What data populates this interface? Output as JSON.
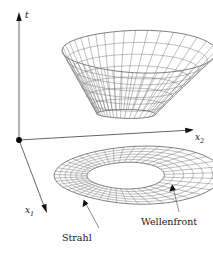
{
  "figure": {
    "background_color": "#ffffff",
    "line_color": "#6f6f6f",
    "outline_color": "#3a3a3a",
    "axis_color": "#555555",
    "text_color": "#1a1a1a"
  },
  "axes": {
    "vertical": {
      "name": "t-axis",
      "label": "t",
      "italic": true,
      "origin": [
        19,
        140
      ],
      "tip": [
        19,
        16
      ]
    },
    "right": {
      "name": "x2-axis",
      "label_base": "x",
      "label_sub": "2",
      "italic": true,
      "origin": [
        19,
        140
      ],
      "tip": [
        193,
        130
      ]
    },
    "front": {
      "name": "x1-axis",
      "label_base": "x",
      "label_sub": "1",
      "italic": true,
      "origin": [
        19,
        140
      ],
      "tip": [
        48,
        213
      ]
    },
    "origin_label": ""
  },
  "annotations": [
    {
      "name": "strahl",
      "label": "Strahl",
      "text_pos": [
        62,
        233
      ],
      "leader_from": [
        99,
        228
      ],
      "leader_to": [
        84,
        201
      ]
    },
    {
      "name": "wellenfront",
      "label": "Wellenfront",
      "text_pos": [
        141,
        217
      ],
      "leader_from": [
        179,
        212
      ],
      "leader_to": [
        172,
        185
      ]
    }
  ],
  "surfaces": {
    "upper": {
      "name": "light-cone-funnel",
      "description": "wireframe funnel surface above the x1-x2 plane",
      "bounds": [
        48,
        32,
        188,
        124
      ],
      "u_divisions": 24,
      "v_divisions": 7
    },
    "lower": {
      "name": "wavefront-ring",
      "description": "kidney-shaped annular wireframe in the x1-x2 plane",
      "bounds": [
        40,
        148,
        190,
        205
      ],
      "u_divisions": 36,
      "v_divisions": 6
    }
  }
}
